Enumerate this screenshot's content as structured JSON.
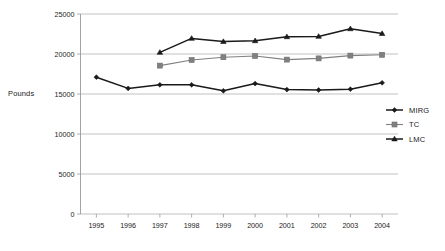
{
  "chart_data": {
    "type": "line",
    "title": "",
    "xlabel": "",
    "ylabel": "Pounds",
    "categories": [
      "1995",
      "1996",
      "1997",
      "1998",
      "1999",
      "2000",
      "2001",
      "2002",
      "2003",
      "2004"
    ],
    "x": [
      1995,
      1996,
      1997,
      1998,
      1999,
      2000,
      2001,
      2002,
      2003,
      2004
    ],
    "ylim": [
      0,
      25000
    ],
    "yticks": [
      0,
      5000,
      10000,
      15000,
      20000,
      25000
    ],
    "ytick_labels": [
      "0",
      "5000",
      "10000",
      "15000",
      "20000",
      "25000"
    ],
    "grid": true,
    "legend_position": "right",
    "series": [
      {
        "name": "MIRG",
        "marker": "diamond",
        "color": "#1a1a1a",
        "values": [
          17100,
          15700,
          16150,
          16150,
          15400,
          16300,
          15550,
          15500,
          15600,
          16400
        ]
      },
      {
        "name": "TC",
        "marker": "square",
        "color": "#808080",
        "values": [
          null,
          null,
          18550,
          19250,
          19600,
          19750,
          19300,
          19450,
          19800,
          19900
        ]
      },
      {
        "name": "LMC",
        "marker": "triangle",
        "color": "#1a1a1a",
        "values": [
          null,
          null,
          20200,
          21950,
          21550,
          21650,
          22150,
          22200,
          23150,
          22550
        ]
      }
    ]
  },
  "legend": {
    "entries": [
      {
        "label": "MIRG"
      },
      {
        "label": "TC"
      },
      {
        "label": "LMC"
      }
    ]
  }
}
